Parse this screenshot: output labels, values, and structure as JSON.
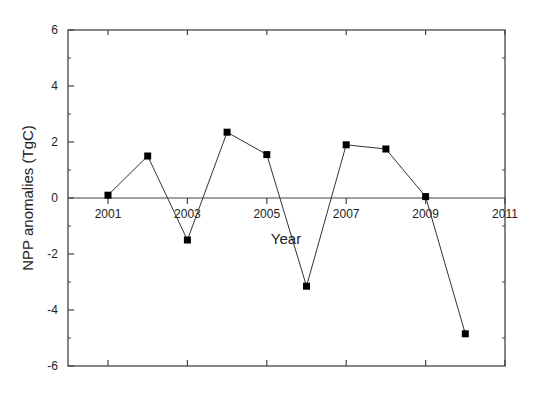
{
  "chart_data": {
    "type": "line",
    "title": "",
    "xlabel": "Year",
    "ylabel": "NPP anomalies (TgC)",
    "xlim": [
      1999.5,
      2011
    ],
    "ylim": [
      -6,
      6
    ],
    "x_ticks": [
      2001,
      2003,
      2005,
      2007,
      2009,
      2011
    ],
    "y_ticks": [
      -6,
      -4,
      -2,
      0,
      2,
      4,
      6
    ],
    "grid": false,
    "legend": null,
    "marker": "square",
    "zero_line": true,
    "series": [
      {
        "name": "NPP anomalies",
        "color": "#000000",
        "x": [
          2001,
          2002,
          2003,
          2004,
          2005,
          2006,
          2007,
          2008,
          2009,
          2010
        ],
        "values": [
          0.1,
          1.5,
          -1.5,
          2.35,
          1.55,
          -3.15,
          1.9,
          1.75,
          0.05,
          -4.85
        ]
      }
    ]
  }
}
